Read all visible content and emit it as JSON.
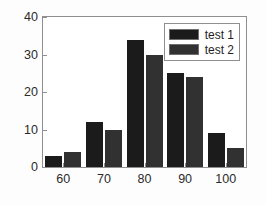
{
  "chart_data": {
    "type": "bar",
    "title": "",
    "xlabel": "",
    "ylabel": "",
    "categories": [
      "60",
      "70",
      "80",
      "90",
      "100"
    ],
    "series": [
      {
        "name": "test 1",
        "color": "#1b1b1b",
        "values": [
          3,
          12,
          34,
          25,
          9
        ]
      },
      {
        "name": "test 2",
        "color": "#313131",
        "values": [
          4,
          10,
          30,
          24,
          5
        ]
      }
    ],
    "ylim": [
      0,
      40
    ],
    "yticks": [
      0,
      10,
      20,
      30,
      40
    ],
    "ytick_labels": [
      "0",
      "10",
      "20",
      "30",
      "40"
    ],
    "xtick_labels": [
      "60",
      "70",
      "80",
      "90",
      "100"
    ],
    "grid": false,
    "legend_position": "upper right",
    "frame_color": "#8f8f8f",
    "plot_background": "#ffffff",
    "figure_background": "#fdfdfd"
  },
  "legend": {
    "entries": [
      {
        "label": "test 1"
      },
      {
        "label": "test 2"
      }
    ]
  }
}
